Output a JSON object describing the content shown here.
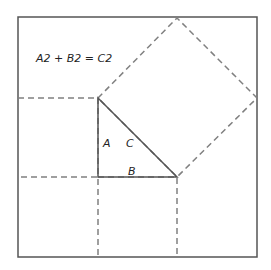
{
  "title": "A2 + B2 = C2",
  "labels": {
    "a": "A",
    "b": "B",
    "c": "C"
  },
  "colors": {
    "background": "#ffffff",
    "solid_line": "#555555",
    "dashed_line": "#808080",
    "text": "#222222"
  },
  "geometry": {
    "outer_box": {
      "x": 18,
      "y": 17,
      "width": 239,
      "height": 240
    },
    "triangle": [
      [
        98,
        98
      ],
      [
        98,
        177
      ],
      [
        177,
        177
      ]
    ],
    "square_a": {
      "x": 18,
      "y": 98,
      "width": 80,
      "height": 79
    },
    "square_b": {
      "x": 98,
      "y": 177,
      "width": 79,
      "height": 80
    },
    "square_c": [
      [
        98,
        98
      ],
      [
        177,
        18
      ],
      [
        257,
        98
      ],
      [
        177,
        177
      ]
    ]
  }
}
